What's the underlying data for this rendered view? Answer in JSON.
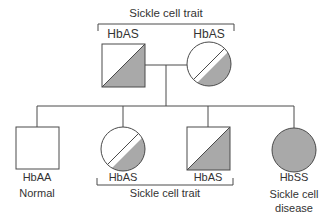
{
  "diagram": {
    "type": "pedigree",
    "colors": {
      "stroke": "#4a4a4a",
      "fill_affected": "#a9a9a9",
      "fill_unaffected": "#ffffff"
    },
    "parents": {
      "bracket_label": "Sickle cell trait",
      "father": {
        "shape": "square",
        "genotype": "HbAS",
        "status": "carrier"
      },
      "mother": {
        "shape": "circle",
        "genotype": "HbAS",
        "status": "carrier"
      }
    },
    "children": [
      {
        "shape": "square",
        "genotype": "HbAA",
        "label": "Normal",
        "status": "unaffected"
      },
      {
        "shape": "circle",
        "genotype": "HbAS",
        "status": "carrier"
      },
      {
        "shape": "square",
        "genotype": "HbAS",
        "status": "carrier"
      },
      {
        "shape": "circle",
        "genotype": "HbSS",
        "label_line1": "Sickle cell",
        "label_line2": "disease",
        "status": "affected"
      }
    ],
    "children_bracket_label": "Sickle cell trait"
  }
}
